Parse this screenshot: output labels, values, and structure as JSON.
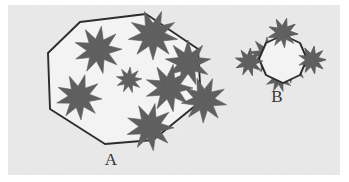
{
  "figure": {
    "background_color": "#e9e9e9",
    "page_color": "#ffffff",
    "star_color": "#5e5e5e",
    "outline_color": "#2b2b2b",
    "polygon_fill_color": "#f4f4f4",
    "label_color": "#333333"
  },
  "groups": [
    {
      "id": "A",
      "label": "A",
      "label_x": 103,
      "label_y": 160,
      "enclosure": {
        "shape": "polygon",
        "sides": 7,
        "points": "72,17 138,9 190,44 193,96 145,135 97,139 42,104 40,48"
      },
      "star_count": 8,
      "description": "Large polygon containing eight well-separated stars",
      "stars": [
        {
          "cx": 90,
          "cy": 45,
          "r": 24,
          "points": 9,
          "rotation": 8
        },
        {
          "cx": 145,
          "cy": 30,
          "r": 25,
          "points": 9,
          "rotation": 20
        },
        {
          "cx": 180,
          "cy": 58,
          "r": 23,
          "points": 9,
          "rotation": 0
        },
        {
          "cx": 71,
          "cy": 92,
          "r": 23,
          "points": 9,
          "rotation": 15
        },
        {
          "cx": 121,
          "cy": 75,
          "r": 13,
          "points": 9,
          "rotation": 5
        },
        {
          "cx": 161,
          "cy": 83,
          "r": 24,
          "points": 9,
          "rotation": 10
        },
        {
          "cx": 196,
          "cy": 95,
          "r": 23,
          "points": 9,
          "rotation": 22
        },
        {
          "cx": 142,
          "cy": 122,
          "r": 24,
          "points": 9,
          "rotation": 12
        }
      ]
    },
    {
      "id": "B",
      "label": "B",
      "label_x": 269,
      "label_y": 97,
      "enclosure": {
        "shape": "polygon",
        "sides": 8,
        "points": "258,38 275,30 292,38 299,54 292,70 275,78 258,70 251,54"
      },
      "star_count": 5,
      "description": "Small polygon with densely overlapping stars spilling beyond the boundary, plus one isolated star outside to the left",
      "stars": [
        {
          "cx": 241,
          "cy": 57,
          "r": 14,
          "points": 9,
          "rotation": 6
        },
        {
          "cx": 275,
          "cy": 28,
          "r": 15,
          "points": 9,
          "rotation": 14
        },
        {
          "cx": 259,
          "cy": 50,
          "r": 18,
          "points": 9,
          "rotation": 0
        },
        {
          "cx": 282,
          "cy": 58,
          "r": 20,
          "points": 9,
          "rotation": 18
        },
        {
          "cx": 304,
          "cy": 55,
          "r": 14,
          "points": 9,
          "rotation": 9
        },
        {
          "cx": 271,
          "cy": 73,
          "r": 14,
          "points": 9,
          "rotation": 3
        }
      ]
    }
  ]
}
